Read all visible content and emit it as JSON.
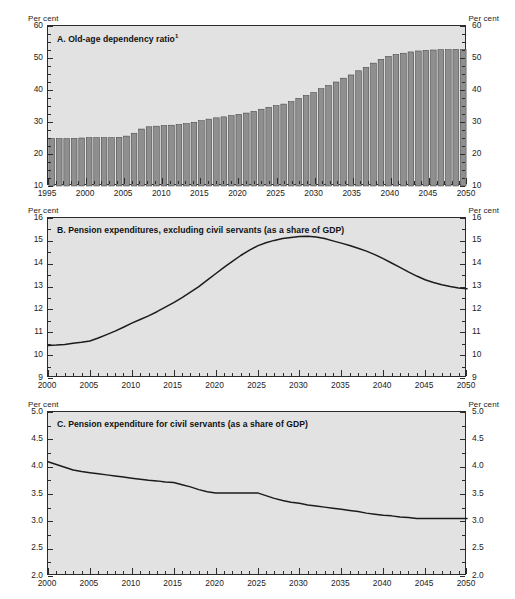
{
  "axis_label": "Per cent",
  "panels": [
    {
      "id": "A",
      "title": "A.  Old-age dependency ratio",
      "title_superscript": "1"
    },
    {
      "id": "B",
      "title": "B.  Pension expenditures, excluding civil servants (as a share of GDP)",
      "title_superscript": ""
    },
    {
      "id": "C",
      "title": "C.  Pension expenditure for civil servants (as a share of GDP)",
      "title_superscript": ""
    }
  ],
  "chart_data": [
    {
      "type": "bar",
      "panel": "A",
      "title": "A.  Old-age dependency ratio",
      "title_note": "1",
      "xlabel": "",
      "ylabel": "Per cent",
      "ylim": [
        10,
        60
      ],
      "yticks": [
        10,
        20,
        30,
        40,
        50,
        60
      ],
      "ytick_labels": [
        "10",
        "20",
        "30",
        "40",
        "50",
        "60"
      ],
      "y_minor_step": 2.5,
      "xlim": [
        1995,
        2050
      ],
      "xticks": [
        1995,
        2000,
        2005,
        2010,
        2015,
        2020,
        2025,
        2030,
        2035,
        2040,
        2045,
        2050
      ],
      "xtick_labels": [
        "1995",
        "2000",
        "2005",
        "2010",
        "2015",
        "2020",
        "2025",
        "2030",
        "2035",
        "2040",
        "2045",
        "2050"
      ],
      "grid": false,
      "legend": false,
      "bar_color": "#8f8f8f",
      "bar_edge_color": "#3a3a3a",
      "categories": [
        1995,
        1996,
        1997,
        1998,
        1999,
        2000,
        2001,
        2002,
        2003,
        2004,
        2005,
        2006,
        2007,
        2008,
        2009,
        2010,
        2011,
        2012,
        2013,
        2014,
        2015,
        2016,
        2017,
        2018,
        2019,
        2020,
        2021,
        2022,
        2023,
        2024,
        2025,
        2026,
        2027,
        2028,
        2029,
        2030,
        2031,
        2032,
        2033,
        2034,
        2035,
        2036,
        2037,
        2038,
        2039,
        2040,
        2041,
        2042,
        2043,
        2044,
        2045,
        2046,
        2047,
        2048,
        2049,
        2050
      ],
      "values": [
        24.9,
        24.8,
        24.8,
        24.9,
        25.0,
        25.1,
        25.1,
        25.1,
        25.1,
        25.2,
        25.6,
        26.5,
        27.8,
        28.5,
        28.7,
        28.9,
        29.0,
        29.2,
        29.5,
        29.9,
        30.4,
        30.9,
        31.3,
        31.6,
        32.0,
        32.4,
        32.8,
        33.3,
        34.0,
        34.6,
        35.1,
        35.6,
        36.4,
        37.4,
        38.3,
        39.2,
        40.4,
        41.4,
        42.5,
        43.7,
        44.7,
        46.0,
        47.1,
        48.4,
        49.6,
        50.5,
        51.1,
        51.5,
        51.9,
        52.2,
        52.4,
        52.5,
        52.6,
        52.6,
        52.7,
        52.7
      ]
    },
    {
      "type": "line",
      "panel": "B",
      "title": "B.  Pension expenditures, excluding civil servants (as a share of GDP)",
      "xlabel": "",
      "ylabel": "Per cent",
      "ylim": [
        9,
        16
      ],
      "yticks": [
        9,
        10,
        11,
        12,
        13,
        14,
        15,
        16
      ],
      "ytick_labels": [
        "9",
        "10",
        "11",
        "12",
        "13",
        "14",
        "15",
        "16"
      ],
      "xlim": [
        2000,
        2050
      ],
      "xticks": [
        2000,
        2005,
        2010,
        2015,
        2020,
        2025,
        2030,
        2035,
        2040,
        2045,
        2050
      ],
      "xtick_labels": [
        "2000",
        "2005",
        "2010",
        "2015",
        "2020",
        "2025",
        "2030",
        "2035",
        "2040",
        "2045",
        "2050"
      ],
      "grid": false,
      "legend": false,
      "line_color": "#1c1c1c",
      "x": [
        2000,
        2001,
        2002,
        2003,
        2004,
        2005,
        2006,
        2007,
        2008,
        2009,
        2010,
        2011,
        2012,
        2013,
        2014,
        2015,
        2016,
        2017,
        2018,
        2019,
        2020,
        2021,
        2022,
        2023,
        2024,
        2025,
        2026,
        2027,
        2028,
        2029,
        2030,
        2031,
        2032,
        2033,
        2034,
        2035,
        2036,
        2037,
        2038,
        2039,
        2040,
        2041,
        2042,
        2043,
        2044,
        2045,
        2046,
        2047,
        2048,
        2049,
        2050
      ],
      "y": [
        10.42,
        10.44,
        10.47,
        10.52,
        10.56,
        10.62,
        10.75,
        10.9,
        11.05,
        11.22,
        11.4,
        11.56,
        11.72,
        11.9,
        12.1,
        12.3,
        12.52,
        12.76,
        13.0,
        13.28,
        13.56,
        13.84,
        14.1,
        14.36,
        14.58,
        14.78,
        14.92,
        15.02,
        15.1,
        15.15,
        15.19,
        15.2,
        15.17,
        15.1,
        15.0,
        14.9,
        14.8,
        14.68,
        14.55,
        14.4,
        14.22,
        14.03,
        13.84,
        13.64,
        13.46,
        13.3,
        13.18,
        13.08,
        13.0,
        12.94,
        12.9
      ]
    },
    {
      "type": "line",
      "panel": "C",
      "title": "C.  Pension expenditure for civil servants (as a share of GDP)",
      "xlabel": "",
      "ylabel": "Per cent",
      "ylim": [
        2.0,
        5.0
      ],
      "yticks": [
        2.0,
        2.5,
        3.0,
        3.5,
        4.0,
        4.5,
        5.0
      ],
      "ytick_labels": [
        "2.0",
        "2.5",
        "3.0",
        "3.5",
        "4.0",
        "4.5",
        "5.0"
      ],
      "xlim": [
        2000,
        2050
      ],
      "xticks": [
        2000,
        2005,
        2010,
        2015,
        2020,
        2025,
        2030,
        2035,
        2040,
        2045,
        2050
      ],
      "xtick_labels": [
        "2000",
        "2005",
        "2010",
        "2015",
        "2020",
        "2025",
        "2030",
        "2035",
        "2040",
        "2045",
        "2050"
      ],
      "grid": false,
      "legend": false,
      "line_color": "#1c1c1c",
      "x": [
        2000,
        2001,
        2002,
        2003,
        2004,
        2005,
        2006,
        2007,
        2008,
        2009,
        2010,
        2011,
        2012,
        2013,
        2014,
        2015,
        2016,
        2017,
        2018,
        2019,
        2020,
        2021,
        2022,
        2023,
        2024,
        2025,
        2026,
        2027,
        2028,
        2029,
        2030,
        2031,
        2032,
        2033,
        2034,
        2035,
        2036,
        2037,
        2038,
        2039,
        2040,
        2041,
        2042,
        2043,
        2044,
        2045,
        2046,
        2047,
        2048,
        2049,
        2050
      ],
      "y": [
        4.09,
        4.04,
        3.99,
        3.94,
        3.91,
        3.89,
        3.87,
        3.85,
        3.83,
        3.81,
        3.79,
        3.77,
        3.75,
        3.74,
        3.72,
        3.71,
        3.67,
        3.63,
        3.58,
        3.54,
        3.52,
        3.52,
        3.52,
        3.52,
        3.52,
        3.52,
        3.47,
        3.42,
        3.38,
        3.35,
        3.33,
        3.3,
        3.28,
        3.26,
        3.24,
        3.22,
        3.2,
        3.18,
        3.15,
        3.13,
        3.11,
        3.1,
        3.08,
        3.07,
        3.05,
        3.05,
        3.05,
        3.05,
        3.05,
        3.05,
        3.05
      ]
    }
  ]
}
